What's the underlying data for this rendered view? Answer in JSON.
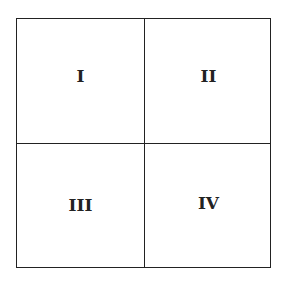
{
  "diagram": {
    "type": "2x2 grid",
    "quadrants": [
      {
        "label": "I"
      },
      {
        "label": "II"
      },
      {
        "label": "III"
      },
      {
        "label": "IV"
      }
    ]
  }
}
